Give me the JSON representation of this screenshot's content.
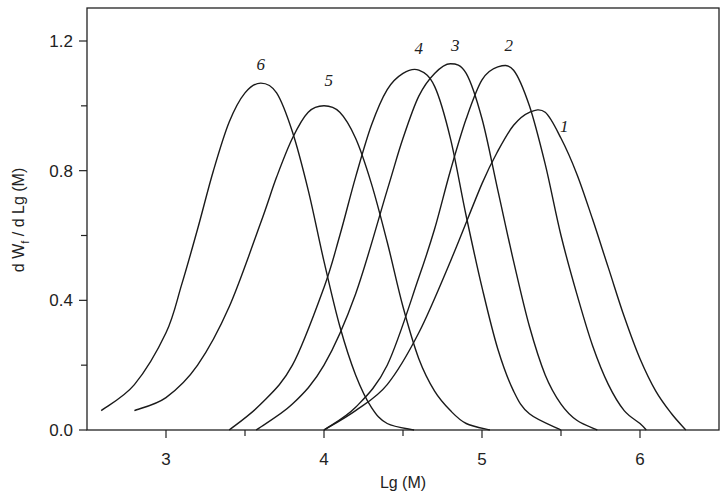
{
  "chart_data": {
    "type": "line",
    "title": "",
    "xlabel": "Lg (M)",
    "ylabel": "d W_f / d Lg (M)",
    "xlim": [
      2.5,
      6.5
    ],
    "ylim": [
      0.0,
      1.3
    ],
    "x_ticks": [
      3,
      4,
      5,
      6
    ],
    "x_tick_labels": [
      "3",
      "4",
      "5",
      "6"
    ],
    "x_minor_ticks": [
      3.5,
      4.5,
      5.5
    ],
    "y_ticks": [
      0.0,
      0.4,
      0.8,
      1.2
    ],
    "y_tick_labels": [
      "0.0",
      "0.4",
      "0.8",
      "1.2"
    ],
    "y_minor_ticks": [
      0.2,
      0.6,
      1.0
    ],
    "grid": false,
    "legend": "inline curve labels",
    "series": [
      {
        "name": "1",
        "label_pos": [
          5.52,
          0.92
        ],
        "peak": [
          5.34,
          0.99
        ],
        "x": [
          4.0,
          4.2,
          4.4,
          4.6,
          4.8,
          5.0,
          5.1,
          5.2,
          5.3,
          5.4,
          5.5,
          5.6,
          5.7,
          5.8,
          5.9,
          6.0,
          6.1,
          6.2,
          6.29
        ],
        "y": [
          0.0,
          0.06,
          0.14,
          0.3,
          0.52,
          0.76,
          0.86,
          0.94,
          0.98,
          0.98,
          0.9,
          0.79,
          0.65,
          0.5,
          0.35,
          0.22,
          0.12,
          0.05,
          0.0
        ]
      },
      {
        "name": "2",
        "label_pos": [
          5.17,
          1.17
        ],
        "peak": [
          5.12,
          1.125
        ],
        "x": [
          4.0,
          4.2,
          4.4,
          4.6,
          4.7,
          4.8,
          4.9,
          5.0,
          5.1,
          5.2,
          5.3,
          5.4,
          5.5,
          5.6,
          5.7,
          5.8,
          5.9,
          6.0,
          6.04
        ],
        "y": [
          0.0,
          0.07,
          0.2,
          0.47,
          0.62,
          0.8,
          0.96,
          1.08,
          1.12,
          1.11,
          1.0,
          0.82,
          0.6,
          0.42,
          0.26,
          0.14,
          0.06,
          0.02,
          0.0
        ]
      },
      {
        "name": "3",
        "label_pos": [
          4.83,
          1.17
        ],
        "peak": [
          4.83,
          1.13
        ],
        "x": [
          3.57,
          3.8,
          4.0,
          4.2,
          4.4,
          4.5,
          4.6,
          4.7,
          4.8,
          4.9,
          5.0,
          5.1,
          5.2,
          5.3,
          5.4,
          5.5,
          5.6,
          5.73
        ],
        "y": [
          0.0,
          0.08,
          0.2,
          0.42,
          0.74,
          0.9,
          1.03,
          1.1,
          1.13,
          1.1,
          0.96,
          0.74,
          0.52,
          0.32,
          0.17,
          0.08,
          0.03,
          0.0
        ]
      },
      {
        "name": "4",
        "label_pos": [
          4.6,
          1.16
        ],
        "peak": [
          4.61,
          1.11
        ],
        "x": [
          3.4,
          3.6,
          3.8,
          4.0,
          4.1,
          4.2,
          4.3,
          4.4,
          4.5,
          4.6,
          4.7,
          4.8,
          4.9,
          5.0,
          5.1,
          5.2,
          5.3,
          5.5
        ],
        "y": [
          0.0,
          0.08,
          0.2,
          0.44,
          0.6,
          0.78,
          0.94,
          1.05,
          1.1,
          1.11,
          1.06,
          0.9,
          0.66,
          0.44,
          0.25,
          0.12,
          0.05,
          0.0
        ]
      },
      {
        "name": "5",
        "label_pos": [
          4.03,
          1.06
        ],
        "peak": [
          4.0,
          1.0
        ],
        "x": [
          2.8,
          3.0,
          3.2,
          3.4,
          3.6,
          3.7,
          3.8,
          3.9,
          4.0,
          4.1,
          4.2,
          4.3,
          4.4,
          4.5,
          4.6,
          4.7,
          4.8,
          4.9,
          5.05
        ],
        "y": [
          0.06,
          0.1,
          0.2,
          0.38,
          0.64,
          0.78,
          0.9,
          0.98,
          1.0,
          0.98,
          0.9,
          0.76,
          0.58,
          0.38,
          0.22,
          0.12,
          0.06,
          0.02,
          0.0
        ]
      },
      {
        "name": "6",
        "label_pos": [
          3.6,
          1.11
        ],
        "peak": [
          3.6,
          1.07
        ],
        "x": [
          2.59,
          2.8,
          3.0,
          3.1,
          3.2,
          3.3,
          3.4,
          3.5,
          3.6,
          3.7,
          3.8,
          3.9,
          4.0,
          4.1,
          4.2,
          4.3,
          4.4,
          4.57
        ],
        "y": [
          0.06,
          0.14,
          0.3,
          0.45,
          0.62,
          0.8,
          0.95,
          1.04,
          1.07,
          1.04,
          0.92,
          0.74,
          0.52,
          0.32,
          0.17,
          0.07,
          0.02,
          0.0
        ]
      }
    ]
  }
}
